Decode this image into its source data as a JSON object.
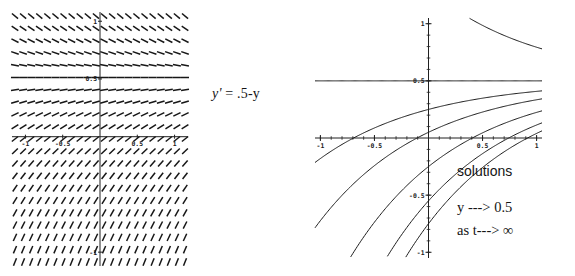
{
  "figure": {
    "background_color": "#ffffff",
    "ink_color": "#141414"
  },
  "equation": {
    "lhs": "y'",
    "eq": " = ",
    "rhs": ".5-y",
    "full": "y' = .5-y"
  },
  "annotations": {
    "solutions": "solutions",
    "limit_y": "y ---> 0.5",
    "limit_t": "as t---> ∞"
  },
  "slope_field_plot": {
    "name": "slope-field",
    "xlim": [
      -1.18,
      1.18
    ],
    "ylim": [
      -1.12,
      1.08
    ],
    "xticks": [
      -1,
      -0.5,
      0.5,
      1
    ],
    "xtick_labels": [
      "-1",
      "-0.5",
      "0.5",
      "1"
    ],
    "yticks": [
      -1,
      0.5,
      1
    ],
    "ytick_labels": [
      "-1",
      "0.5",
      "1"
    ],
    "grid": false,
    "equilibrium_y": 0.5,
    "slope_formula": "dy/dt = 0.5 - y",
    "columns": 22,
    "rows": 21
  },
  "chart_data": {
    "type": "line",
    "title": "solutions",
    "xlabel": "t",
    "ylabel": "y",
    "xlim": [
      -1.05,
      1.05
    ],
    "ylim": [
      -1.05,
      1.05
    ],
    "xticks": [
      -1,
      -0.5,
      0.5,
      1
    ],
    "xtick_labels": [
      "-1",
      "-0.5",
      "0.5",
      "1"
    ],
    "yticks": [
      -1,
      -0.5,
      0.5,
      1
    ],
    "ytick_labels": [
      "-1",
      "-0.5",
      "0.5",
      "1"
    ],
    "grid": false,
    "legend": "none",
    "equation": "y = 0.5 + C e^(-t)",
    "asymptote": 0.5,
    "series": [
      {
        "name": "C = 0.8",
        "C": 0.8
      },
      {
        "name": "C = 0.0",
        "C": 0.0
      },
      {
        "name": "C = -0.25",
        "C": -0.25
      },
      {
        "name": "C = -0.45",
        "C": -0.45
      },
      {
        "name": "C = -0.75",
        "C": -0.75
      },
      {
        "name": "C = -1.05",
        "C": -1.05
      },
      {
        "name": "C = -1.25",
        "C": -1.25
      }
    ],
    "annotations": [
      "solutions",
      "y ---> 0.5",
      "as t---> ∞"
    ]
  }
}
